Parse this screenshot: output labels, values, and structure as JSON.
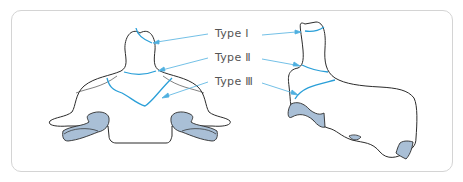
{
  "diagram": {
    "views": [
      "anterior-view",
      "lateral-view"
    ],
    "labels": [
      {
        "id": "type-1",
        "text": "Type Ⅰ"
      },
      {
        "id": "type-2",
        "text": "Type Ⅱ"
      },
      {
        "id": "type-3",
        "text": "Type Ⅲ"
      }
    ],
    "colors": {
      "outline": "#2b2b2b",
      "fracture_line": "#2a9fd8",
      "arrow": "#4fb0e0",
      "facet_fill": "#a9bfd6",
      "frame_border": "#d4d4d4",
      "label_text": "#555555"
    }
  }
}
